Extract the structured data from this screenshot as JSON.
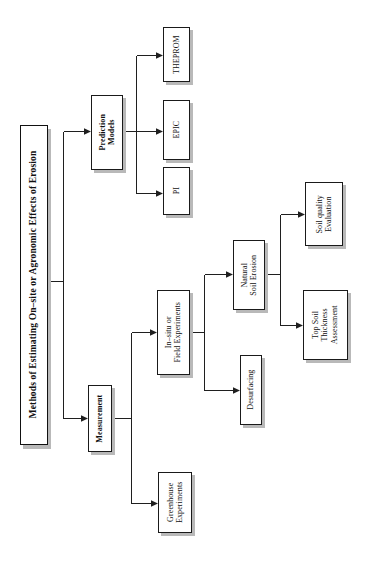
{
  "diagram": {
    "orientation": "rotated-90-ccw",
    "type": "hierarchical-tree",
    "root": {
      "id": "root",
      "label": "Methods of Estimating On–site or Agronomic Effects of Erosion"
    },
    "nodes": [
      {
        "id": "root",
        "label": "Methods of Estimating On–site or Agronomic Effects of Erosion",
        "level": 0,
        "bold": true
      },
      {
        "id": "prediction",
        "label": "Prediction\nModels",
        "level": 1,
        "bold": true
      },
      {
        "id": "measurement",
        "label": "Measurement",
        "level": 1,
        "bold": true
      },
      {
        "id": "pi",
        "label": "PI",
        "level": 2,
        "bold": false
      },
      {
        "id": "epic",
        "label": "EPIC",
        "level": 2,
        "bold": false
      },
      {
        "id": "theprom",
        "label": "THEPROM",
        "level": 2,
        "bold": false
      },
      {
        "id": "greenhouse",
        "label": "Greenhouse\nExperiments",
        "level": 2,
        "bold": false
      },
      {
        "id": "insitu",
        "label": "In–situ or\nField Experiments",
        "level": 2,
        "bold": false
      },
      {
        "id": "desurfacing",
        "label": "Desurfacing",
        "level": 3,
        "bold": false
      },
      {
        "id": "natural",
        "label": "Natural\nSoil Erosion",
        "level": 3,
        "bold": false
      },
      {
        "id": "soilquality",
        "label": "Soil quality\nEvaluation",
        "level": 4,
        "bold": false
      },
      {
        "id": "topsoil",
        "label": "Top Soil\nThickness\nAssessment",
        "level": 4,
        "bold": false
      }
    ],
    "edges": [
      {
        "from": "root",
        "to": "prediction"
      },
      {
        "from": "root",
        "to": "measurement"
      },
      {
        "from": "prediction",
        "to": "pi"
      },
      {
        "from": "prediction",
        "to": "epic"
      },
      {
        "from": "prediction",
        "to": "theprom"
      },
      {
        "from": "measurement",
        "to": "greenhouse"
      },
      {
        "from": "measurement",
        "to": "insitu"
      },
      {
        "from": "insitu",
        "to": "desurfacing"
      },
      {
        "from": "insitu",
        "to": "natural"
      },
      {
        "from": "natural",
        "to": "soilquality"
      },
      {
        "from": "natural",
        "to": "topsoil"
      }
    ],
    "colors": {
      "stroke": "#1f1f1f",
      "box_fill": "#ffffff",
      "shadow": "#b9b9b9",
      "text": "#111111",
      "background": "#ffffff"
    }
  }
}
